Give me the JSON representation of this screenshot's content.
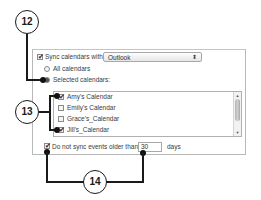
{
  "dialog": {
    "sync_checkbox": {
      "label": "Sync calendars with:",
      "checked": true
    },
    "sync_source": {
      "selected": "Outlook",
      "arrows": "⬍"
    },
    "radio_all": {
      "label": "All calendars",
      "selected": false
    },
    "radio_selected": {
      "label": "Selected calendars:",
      "selected": true
    },
    "calendars": [
      {
        "label": "Amy's Calendar",
        "checked": true
      },
      {
        "label": "Emily's Calendar",
        "checked": false
      },
      {
        "label": "Grace's_Calendar",
        "checked": false
      },
      {
        "label": "Jill's_Calendar",
        "checked": true
      }
    ],
    "scroll_up": "▲",
    "scroll_down": "▼",
    "older_checkbox": {
      "label": "Do not sync events older than",
      "checked": true
    },
    "days_value": "30",
    "days_unit": "days",
    "check_glyph": "✔"
  },
  "callouts": {
    "c12": "12",
    "c13": "13",
    "c14": "14"
  }
}
